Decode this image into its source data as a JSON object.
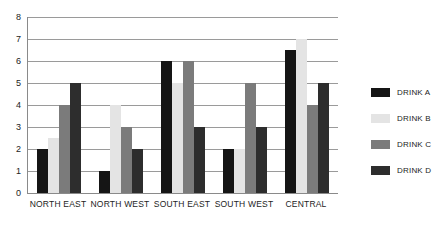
{
  "chart_data": {
    "type": "bar",
    "title": "",
    "subtitle": "",
    "xlabel": "",
    "ylabel": "",
    "ylim": [
      0,
      8
    ],
    "ytick_labels": [
      "8",
      "7",
      "6",
      "5",
      "4",
      "3",
      "2",
      "1",
      "0"
    ],
    "yticks": [
      8,
      7,
      6,
      5,
      4,
      3,
      2,
      1,
      0
    ],
    "grid": true,
    "grid_axis": "y",
    "legend_position": "right",
    "categories": [
      "NORTH EAST",
      "NORTH WEST",
      "SOUTH EAST",
      "SOUTH WEST",
      "CENTRAL"
    ],
    "series": [
      {
        "name": "DRINK A",
        "color": "#151515",
        "values": [
          2,
          1,
          6,
          2,
          6.5
        ]
      },
      {
        "name": "DRINK B",
        "color": "#e4e4e4",
        "values": [
          2.5,
          4,
          5,
          2,
          7
        ]
      },
      {
        "name": "DRINK C",
        "color": "#7b7b7b",
        "values": [
          4,
          3,
          6,
          5,
          4
        ]
      },
      {
        "name": "DRINK D",
        "color": "#2d2d2d",
        "values": [
          5,
          2,
          3,
          3,
          5
        ]
      }
    ]
  },
  "axis": {
    "line_color": "#8a8a8a",
    "grid_color": "#9a9a9a"
  }
}
